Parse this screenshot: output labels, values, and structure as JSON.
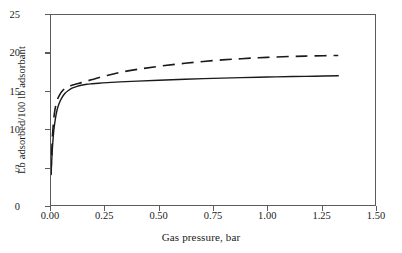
{
  "chart_data": {
    "type": "line",
    "title": "",
    "xlabel": "Gas pressure, bar",
    "ylabel": "Lb adsorbed/100 lb adsorbant",
    "xlim": [
      0.0,
      1.5
    ],
    "ylim": [
      0,
      25
    ],
    "xticks": [
      "0.00",
      "0.25",
      "0.50",
      "0.75",
      "1.00",
      "1.25",
      "1.50"
    ],
    "xtick_values": [
      0.0,
      0.25,
      0.5,
      0.75,
      1.0,
      1.25,
      1.5
    ],
    "yticks": [
      "0",
      "5",
      "10",
      "15",
      "20",
      "25"
    ],
    "ytick_values": [
      0,
      5,
      10,
      15,
      20,
      25
    ],
    "grid": false,
    "legend": "none",
    "line_color": "#1a1a1a",
    "axis_color": "#5b5b5b",
    "background": "#ffffff",
    "series": [
      {
        "name": "solid-curve",
        "style": "solid",
        "color": "#1a1a1a",
        "x": [
          0.0,
          0.004,
          0.008,
          0.013,
          0.02,
          0.028,
          0.038,
          0.05,
          0.065,
          0.082,
          0.1,
          0.12,
          0.14,
          0.165,
          0.19,
          0.22,
          0.26,
          0.32,
          0.4,
          0.5,
          0.62,
          0.75,
          0.88,
          1.0,
          1.12,
          1.22,
          1.33
        ],
        "y": [
          4.0,
          6.2,
          8.1,
          9.8,
          11.3,
          12.5,
          13.4,
          14.1,
          14.7,
          15.1,
          15.4,
          15.6,
          15.75,
          15.88,
          15.95,
          16.02,
          16.1,
          16.2,
          16.3,
          16.42,
          16.55,
          16.66,
          16.76,
          16.84,
          16.9,
          16.95,
          17.0
        ]
      },
      {
        "name": "dashed-curve",
        "style": "dashed",
        "color": "#1a1a1a",
        "dash_pattern": "12 7",
        "x": [
          0.0,
          0.003,
          0.006,
          0.01,
          0.015,
          0.022,
          0.03,
          0.04,
          0.052,
          0.066,
          0.082,
          0.1,
          0.12,
          0.14,
          0.165,
          0.19,
          0.22,
          0.26,
          0.32,
          0.4,
          0.5,
          0.62,
          0.75,
          0.88,
          1.0,
          1.12,
          1.22,
          1.33
        ],
        "y": [
          4.0,
          6.6,
          8.7,
          10.4,
          11.9,
          13.1,
          13.9,
          14.5,
          15.0,
          15.35,
          15.6,
          15.8,
          15.95,
          16.1,
          16.3,
          16.5,
          16.75,
          17.05,
          17.45,
          17.85,
          18.25,
          18.65,
          19.0,
          19.25,
          19.42,
          19.55,
          19.62,
          19.68
        ]
      }
    ]
  }
}
